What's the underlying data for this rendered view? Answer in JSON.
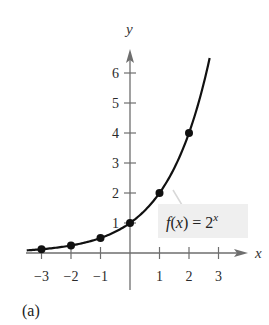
{
  "chart_data": {
    "type": "line",
    "title": "",
    "function_label": {
      "prefix": "f(x) = 2",
      "exponent": "x"
    },
    "xlabel": "x",
    "ylabel": "y",
    "panel_label": "(a)",
    "xlim": [
      -3.5,
      3.9
    ],
    "ylim": [
      -0.3,
      6.9
    ],
    "x_ticks": [
      -3,
      -2,
      -1,
      1,
      2,
      3
    ],
    "x_tick_labels": [
      "−3",
      "−2",
      "−1",
      "1",
      "2",
      "3"
    ],
    "y_ticks": [
      1,
      2,
      3,
      4,
      5,
      6
    ],
    "y_tick_labels": [
      "1",
      "2",
      "3",
      "4",
      "5",
      "6"
    ],
    "grid": false,
    "series": [
      {
        "name": "f(x) = 2^x",
        "curve_domain": [
          -3.5,
          2.7
        ],
        "points": [
          {
            "x": -3,
            "y": 0.125
          },
          {
            "x": -2,
            "y": 0.25
          },
          {
            "x": -1,
            "y": 0.5
          },
          {
            "x": 0,
            "y": 1
          },
          {
            "x": 1,
            "y": 2
          },
          {
            "x": 2,
            "y": 4
          }
        ]
      }
    ],
    "colors": {
      "curve": "#111111",
      "axis": "#6e6e6e",
      "label_box": "#efefef"
    }
  }
}
